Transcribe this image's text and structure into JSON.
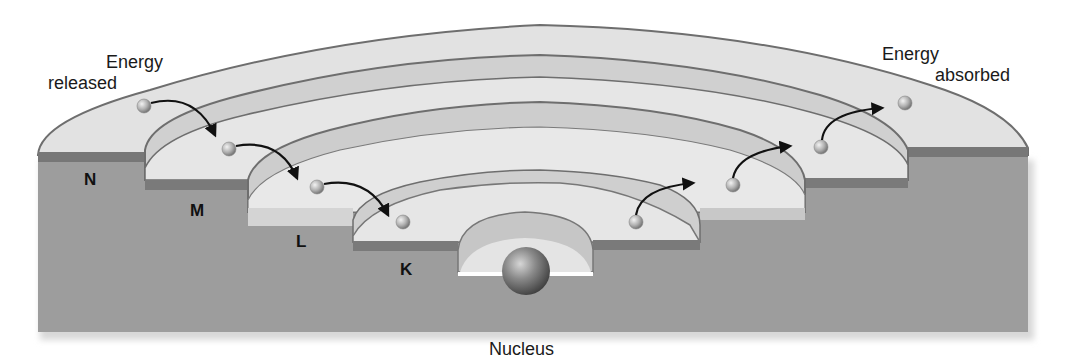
{
  "diagram": {
    "labels": {
      "energy_released": {
        "line1": "Energy",
        "line2": "released"
      },
      "energy_absorbed": {
        "line1": "Energy",
        "line2": "absorbed"
      },
      "nucleus": "Nucleus"
    },
    "shells": [
      {
        "id": "N",
        "label": "N"
      },
      {
        "id": "M",
        "label": "M"
      },
      {
        "id": "L",
        "label": "L"
      },
      {
        "id": "K",
        "label": "K"
      }
    ],
    "transitions": [
      {
        "direction": "released",
        "from": "N",
        "to": "M"
      },
      {
        "direction": "released",
        "from": "M",
        "to": "L"
      },
      {
        "direction": "released",
        "from": "L",
        "to": "K"
      },
      {
        "direction": "absorbed",
        "from": "K",
        "to": "L"
      },
      {
        "direction": "absorbed",
        "from": "L",
        "to": "M"
      },
      {
        "direction": "absorbed",
        "from": "M",
        "to": "N"
      }
    ],
    "colors": {
      "base_block": "#9a9a9a",
      "shell_band_dark": "#7a7a7a",
      "shell_surface_light": "#e4e4e4",
      "shell_surface_mid": "#c8c8c8",
      "arrow": "#111111"
    }
  }
}
